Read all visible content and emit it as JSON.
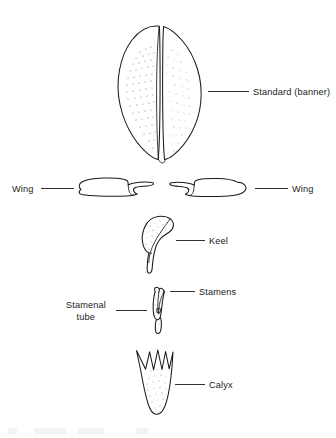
{
  "figure": {
    "background_color": "#ffffff",
    "line_color": "#1a1a1a",
    "stipple_color": "#6e6e6e",
    "width": 336,
    "height": 438
  },
  "labels": {
    "standard": "Standard (banner)",
    "wing_left": "Wing",
    "wing_right": "Wing",
    "keel": "Keel",
    "stamens": "Stamens",
    "stamenal_tube_line1": "Stamenal",
    "stamenal_tube_line2": "tube",
    "calyx": "Calyx"
  },
  "parts": [
    {
      "name": "standard-banner",
      "label": "Standard (banner)",
      "label_side": "right",
      "description": "large bilobed petal with central fold and stippled surface"
    },
    {
      "name": "wing-left",
      "label": "Wing",
      "label_side": "left",
      "description": "lateral petal with hooked claw, pointing right"
    },
    {
      "name": "wing-right",
      "label": "Wing",
      "label_side": "right",
      "description": "lateral petal with hooked claw, pointing left"
    },
    {
      "name": "keel",
      "label": "Keel",
      "label_side": "right",
      "description": "boat-shaped fused petals with narrow claw"
    },
    {
      "name": "stamens",
      "label": "Stamens",
      "label_side": "right",
      "description": "anthers at apex of the staminal column"
    },
    {
      "name": "stamenal-tube",
      "label": "Stamenal tube",
      "label_side": "left",
      "description": "fused filaments forming a tube around the ovary"
    },
    {
      "name": "calyx",
      "label": "Calyx",
      "label_side": "right",
      "description": "fused sepals forming a cone with five pointed lobes"
    }
  ]
}
